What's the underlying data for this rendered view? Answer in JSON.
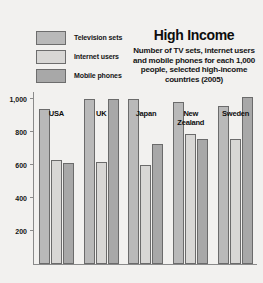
{
  "chart_data": {
    "type": "bar",
    "title": "High Income",
    "subtitle": "Number of TV sets, internet users and mobile phones for each 1,000 people, selected high-income countries (2005)",
    "xlabel": "",
    "ylabel": "",
    "ylim": [
      0,
      1000
    ],
    "grid": false,
    "legend_position": "top-left",
    "ytick_labels": [
      "1,000",
      "800",
      "600",
      "400",
      "200"
    ],
    "ytick_values": [
      1000,
      800,
      600,
      400,
      200
    ],
    "categories": [
      "USA",
      "UK",
      "Japan",
      "New\nZealand",
      "Sweden"
    ],
    "series": [
      {
        "name": "Television sets",
        "color": "#b9b9b9",
        "values": [
          938,
          1000,
          1000,
          980,
          960
        ]
      },
      {
        "name": "Internet users",
        "color": "#d8d7d5",
        "values": [
          630,
          620,
          600,
          790,
          760
        ]
      },
      {
        "name": "Mobile phones",
        "color": "#a8a8a8",
        "values": [
          610,
          1000,
          730,
          760,
          1010
        ]
      }
    ]
  },
  "legend": {
    "items": [
      {
        "label": "Television sets",
        "color": "#b9b9b9"
      },
      {
        "label": "Internet users",
        "color": "#d8d7d5"
      },
      {
        "label": "Mobile phones",
        "color": "#a8a8a8"
      }
    ]
  }
}
